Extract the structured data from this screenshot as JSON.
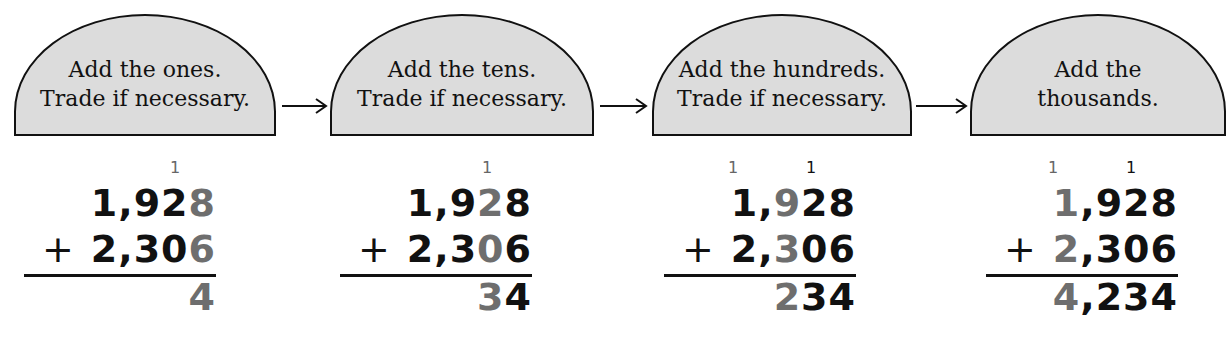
{
  "steps": [
    {
      "title_line1": "Add the ones.",
      "title_line2": "Trade if necessary.",
      "carries": [
        "1"
      ],
      "addend1": {
        "normal": "1,92",
        "highlight": "8"
      },
      "addend2": {
        "plus": "+",
        "normal": "2,30",
        "highlight": "6"
      },
      "sum": {
        "highlight": "4",
        "normal": ""
      }
    },
    {
      "title_line1": "Add the tens.",
      "title_line2": "Trade if necessary.",
      "carries": [
        "1"
      ],
      "addend1": {
        "pre": "1,9",
        "highlight": "2",
        "post": "8"
      },
      "addend2": {
        "plus": "+",
        "pre": "2,3",
        "highlight": "0",
        "post": "6"
      },
      "sum": {
        "highlight": "3",
        "normal": "4"
      }
    },
    {
      "title_line1": "Add the hundreds.",
      "title_line2": "Trade if necessary.",
      "carries": [
        "1",
        "1"
      ],
      "addend1": {
        "pre": "1,",
        "highlight": "9",
        "post": "28"
      },
      "addend2": {
        "plus": "+",
        "pre": "2,",
        "highlight": "3",
        "post": "06"
      },
      "sum": {
        "highlight": "2",
        "normal": "34"
      }
    },
    {
      "title_line1": "Add the",
      "title_line2": "thousands.",
      "carries": [
        "1",
        "1"
      ],
      "addend1": {
        "highlight": "1",
        "post": ",928"
      },
      "addend2": {
        "plus": "+",
        "highlight": "2",
        "post": ",306"
      },
      "sum": {
        "highlight": "4",
        "normal": ",234"
      }
    }
  ],
  "colors": {
    "dome_fill": "#dcdcdc",
    "highlight_digit": "#6e6e6e",
    "text": "#111111"
  }
}
